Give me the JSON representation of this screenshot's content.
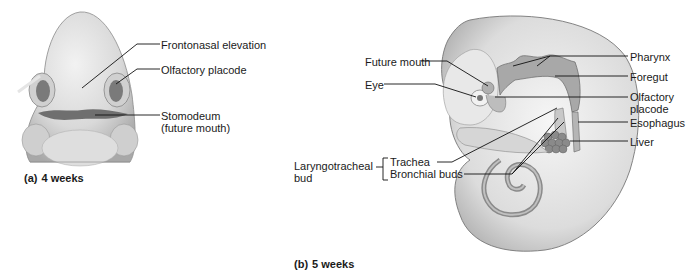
{
  "panel_a": {
    "caption_letter": "(a)",
    "caption_text": "4 weeks",
    "labels": [
      {
        "text": "Frontonasal elevation",
        "x": 161,
        "y": 39
      },
      {
        "text": "Olfactory placode",
        "x": 161,
        "y": 64
      },
      {
        "text": "Stomodeum",
        "x": 161,
        "y": 110
      },
      {
        "text": "(future mouth)",
        "x": 161,
        "y": 122
      }
    ]
  },
  "panel_b": {
    "caption_letter": "(b)",
    "caption_text": "5 weeks",
    "labels_right": [
      {
        "text": "Pharynx",
        "x": 630,
        "y": 51
      },
      {
        "text": "Foregut",
        "x": 630,
        "y": 71
      },
      {
        "text": "Olfactory",
        "x": 630,
        "y": 91
      },
      {
        "text": "placode",
        "x": 630,
        "y": 103
      },
      {
        "text": "Esophagus",
        "x": 630,
        "y": 117
      },
      {
        "text": "Liver",
        "x": 630,
        "y": 136
      }
    ],
    "labels_left": [
      {
        "text": "Future mouth",
        "x": 365,
        "y": 56
      },
      {
        "text": "Eye",
        "x": 365,
        "y": 79
      },
      {
        "text": "Laryngotracheal",
        "x": 294,
        "y": 160
      },
      {
        "text": "bud",
        "x": 294,
        "y": 172
      },
      {
        "text": "Trachea",
        "x": 390,
        "y": 156
      },
      {
        "text": "Bronchial buds",
        "x": 390,
        "y": 168
      }
    ]
  }
}
